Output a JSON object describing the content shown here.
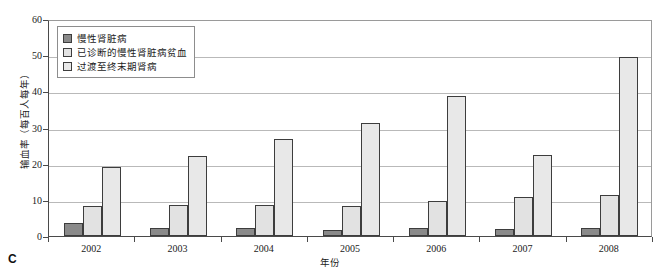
{
  "panel": {
    "letter": "C"
  },
  "chart_data": {
    "type": "bar",
    "title": "",
    "subtitle": "",
    "xlabel": "年份",
    "ylabel": "输血率（每百人每年）",
    "categories": [
      "2002",
      "2003",
      "2004",
      "2005",
      "2006",
      "2007",
      "2008"
    ],
    "series": [
      {
        "name": "慢性肾脏病",
        "color": "#8a8a8a",
        "values": [
          3.5,
          2.2,
          2.2,
          1.7,
          2.2,
          1.9,
          2.2
        ]
      },
      {
        "name": "已诊断的慢性肾脏病贫血",
        "color": "#e2e2e2",
        "values": [
          8.4,
          8.6,
          8.7,
          8.2,
          9.7,
          10.8,
          11.4
        ]
      },
      {
        "name": "过渡至终末期肾病",
        "color": "#e8e8e8",
        "values": [
          19.0,
          22.2,
          26.9,
          31.3,
          38.7,
          22.3,
          49.5
        ]
      }
    ],
    "ylim": [
      0,
      60
    ],
    "yticks": [
      0,
      10,
      20,
      30,
      40,
      50,
      60
    ],
    "ytick_labels": [
      "0",
      "10",
      "20",
      "30",
      "40",
      "50",
      "60"
    ],
    "grid": "horizontal",
    "legend_position": "top-left",
    "bar_border_color": "#3d3d3d",
    "axis_color": "#4a4a4a",
    "gridline_color": "#b9b9b9"
  }
}
